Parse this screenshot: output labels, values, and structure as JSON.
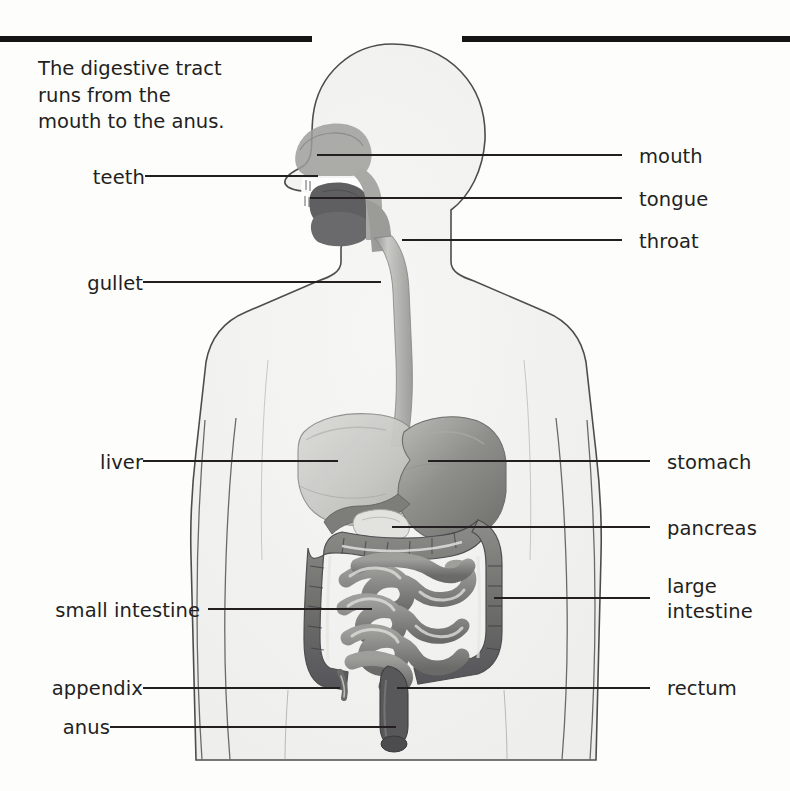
{
  "page": {
    "title": "The digestive tract",
    "background_color": "#fdfdfc",
    "ink_color": "#231f20",
    "rule_color": "#151515"
  },
  "caption": {
    "text": "The digestive tract\nruns from the\nmouth to the anus."
  },
  "labels_left": [
    {
      "id": "teeth",
      "text": "teeth",
      "text_x": 80,
      "text_y": 165,
      "line_x1": 145,
      "line_x2": 318,
      "line_y": 176
    },
    {
      "id": "gullet",
      "text": "gullet",
      "text_x": 73,
      "text_y": 271,
      "line_x1": 143,
      "line_x2": 381,
      "line_y": 282
    },
    {
      "id": "liver",
      "text": "liver",
      "text_x": 86,
      "text_y": 450,
      "line_x1": 143,
      "line_x2": 338,
      "line_y": 461
    },
    {
      "id": "small-intestine",
      "text": "small intestine",
      "text_x": 17,
      "text_y": 598,
      "line_x1": 208,
      "line_x2": 372,
      "line_y": 609
    },
    {
      "id": "appendix",
      "text": "appendix",
      "text_x": 30,
      "text_y": 675,
      "line_x1": 143,
      "line_x2": 340,
      "line_y": 688
    },
    {
      "id": "anus",
      "text": "anus",
      "text_x": 37,
      "text_y": 715,
      "line_x1": 110,
      "line_x2": 396,
      "line_y": 727
    }
  ],
  "labels_right": [
    {
      "id": "mouth",
      "text": "mouth",
      "text_x": 639,
      "text_y": 144,
      "line_x1": 317,
      "line_x2": 622,
      "line_y": 155
    },
    {
      "id": "tongue",
      "text": "tongue",
      "text_x": 639,
      "text_y": 187,
      "line_x1": 310,
      "line_x2": 622,
      "line_y": 198
    },
    {
      "id": "throat",
      "text": "throat",
      "text_x": 639,
      "text_y": 229,
      "line_x1": 402,
      "line_x2": 622,
      "line_y": 240
    },
    {
      "id": "stomach",
      "text": "stomach",
      "text_x": 667,
      "text_y": 450,
      "line_x1": 428,
      "line_x2": 650,
      "line_y": 461
    },
    {
      "id": "pancreas",
      "text": "pancreas",
      "text_x": 667,
      "text_y": 516,
      "line_x1": 392,
      "line_x2": 650,
      "line_y": 527
    },
    {
      "id": "large-intestine",
      "text": "large\nintestine",
      "text_x": 667,
      "text_y": 587,
      "line_x1": 494,
      "line_x2": 650,
      "line_y": 598
    },
    {
      "id": "rectum",
      "text": "rectum",
      "text_x": 667,
      "text_y": 675,
      "line_x1": 397,
      "line_x2": 650,
      "line_y": 688
    }
  ],
  "colors": {
    "body_fill": "#f1f1ef",
    "body_stroke": "#4d4d4d",
    "organ_light": "#cdcdca",
    "organ_mid": "#9a9a97",
    "organ_dark": "#6e6e6b",
    "organ_darker": "#58585a",
    "tongue": "#6a6a6c",
    "highlight": "#e9e9e6"
  }
}
